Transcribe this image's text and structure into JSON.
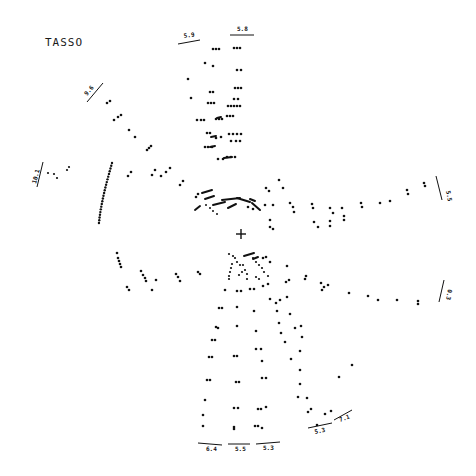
{
  "title": "TASSO",
  "vertex_marker": "+",
  "ink_color": "#111111",
  "background_color": "#ffffff",
  "track_labels": [
    {
      "id": "track-upper-left",
      "text": "5.9"
    },
    {
      "id": "track-top",
      "text": "5.8"
    },
    {
      "id": "track-left-upper",
      "text": "9.6"
    },
    {
      "id": "track-left",
      "text": "10.1"
    },
    {
      "id": "track-right-upper",
      "text": "5.5"
    },
    {
      "id": "track-right-lower",
      "text": "0.3"
    },
    {
      "id": "track-bottom-left",
      "text": "6.4"
    },
    {
      "id": "track-bottom-center",
      "text": "5.5"
    },
    {
      "id": "track-bottom-right",
      "text": "5.3"
    },
    {
      "id": "track-lower-right-a",
      "text": "5.3"
    },
    {
      "id": "track-lower-right-b",
      "text": "7.1"
    }
  ]
}
